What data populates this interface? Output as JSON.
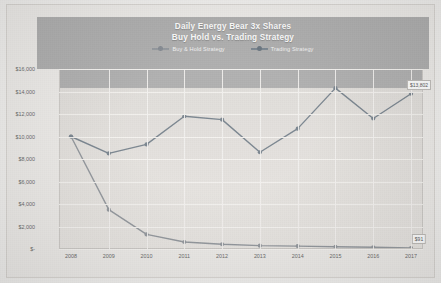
{
  "chart_data": {
    "type": "line",
    "title": "Daily Energy Bear 3x Shares",
    "subtitle": "Buy Hold vs. Trading Strategy",
    "xlabel": "",
    "ylabel": "",
    "categories": [
      "2008",
      "2009",
      "2010",
      "2011",
      "2012",
      "2013",
      "2014",
      "2015",
      "2016",
      "2017"
    ],
    "ylim": [
      0,
      16000
    ],
    "yticks": [
      0,
      2000,
      4000,
      6000,
      8000,
      10000,
      12000,
      14000,
      16000
    ],
    "ytick_labels": [
      "$-",
      "$2,000",
      "$4,000",
      "$6,000",
      "$8,000",
      "$10,000",
      "$12,000",
      "$14,000",
      "$16,000"
    ],
    "grid": true,
    "legend_position": "top",
    "series": [
      {
        "name": "Buy & Hold Strategy",
        "color": "#8a8f95",
        "values": [
          10000,
          3500,
          1300,
          620,
          420,
          300,
          260,
          200,
          150,
          91
        ],
        "end_label": "$91"
      },
      {
        "name": "Trading Strategy",
        "color": "#6f7b86",
        "values": [
          10000,
          8500,
          9300,
          11800,
          11500,
          8600,
          10700,
          14300,
          11600,
          13802
        ],
        "end_label": "$13,802"
      }
    ]
  },
  "legend": {
    "buy_hold": "Buy & Hold Strategy",
    "trading": "Trading Strategy"
  }
}
